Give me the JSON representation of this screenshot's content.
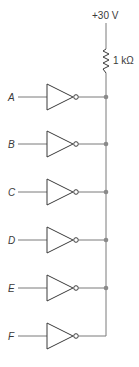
{
  "diagram": {
    "type": "wired-AND inverter circuit",
    "supply": {
      "label": "+30 V"
    },
    "resistor": {
      "label": "1 kΩ"
    },
    "gates": [
      {
        "input": "A",
        "y": 97,
        "junction": true
      },
      {
        "input": "B",
        "y": 144,
        "junction": true
      },
      {
        "input": "C",
        "y": 192,
        "junction": true
      },
      {
        "input": "D",
        "y": 240,
        "junction": true
      },
      {
        "input": "E",
        "y": 288,
        "junction": true
      },
      {
        "input": "F",
        "y": 336,
        "junction": false
      }
    ],
    "colors": {
      "wire": "#7a7a7a",
      "gate": "#3a3a3a",
      "junction": "#8a8a8a"
    }
  }
}
